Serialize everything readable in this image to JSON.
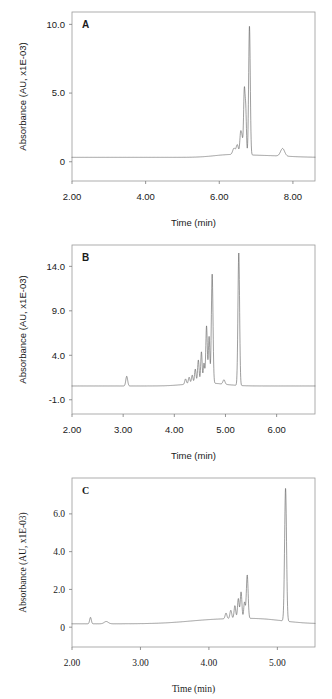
{
  "figure": {
    "name": "hplc-chromatogram-figure",
    "panel_count": 3
  },
  "chart_data": [
    {
      "id": "A",
      "type": "line",
      "panel_letter": "A",
      "title": "",
      "xlabel": "Time (min)",
      "ylabel": "Absorbance (AU, x1E-03)",
      "font_style": "sans-serif",
      "xlim": [
        2.0,
        8.6
      ],
      "ylim": [
        -1.4,
        10.9
      ],
      "xticks": [
        2.0,
        4.0,
        6.0,
        8.0
      ],
      "xtick_labels": [
        "2.00",
        "4.00",
        "6.00",
        "8.00"
      ],
      "yticks": [
        0,
        5.0,
        10.0
      ],
      "ytick_labels": [
        "0",
        "5.0",
        "10.0"
      ],
      "grid": false,
      "legend": "none",
      "baseline": 0.32,
      "series": [
        {
          "name": "absorbance",
          "peaks": [
            {
              "center": 6.4,
              "height": 0.45,
              "width": 0.035
            },
            {
              "center": 6.49,
              "height": 0.7,
              "width": 0.03
            },
            {
              "center": 6.58,
              "height": 1.55,
              "width": 0.022
            },
            {
              "center": 6.62,
              "height": 1.05,
              "width": 0.02
            },
            {
              "center": 6.68,
              "height": 4.65,
              "width": 0.02
            },
            {
              "center": 6.72,
              "height": 3.0,
              "width": 0.018
            },
            {
              "center": 6.82,
              "height": 9.4,
              "width": 0.022
            },
            {
              "center": 7.72,
              "height": 0.55,
              "width": 0.055
            }
          ],
          "drift": [
            {
              "center": 6.3,
              "height": 0.18,
              "width": 0.45
            },
            {
              "center": 7.3,
              "height": 0.12,
              "width": 0.6
            }
          ]
        }
      ]
    },
    {
      "id": "B",
      "type": "line",
      "panel_letter": "B",
      "title": "",
      "xlabel": "Time (min)",
      "ylabel": "Absorbance (AU, x1E-03)",
      "font_style": "sans-serif",
      "xlim": [
        2.0,
        6.75
      ],
      "ylim": [
        -2.6,
        16.4
      ],
      "xticks": [
        2.0,
        3.0,
        4.0,
        5.0,
        6.0
      ],
      "xtick_labels": [
        "2.00",
        "3.00",
        "4.00",
        "5.00",
        "6.00"
      ],
      "yticks": [
        -1.0,
        4.0,
        9.0,
        14.0
      ],
      "ytick_labels": [
        "-1.0",
        "4.0",
        "9.0",
        "14.0"
      ],
      "grid": false,
      "legend": "none",
      "baseline": 0.55,
      "series": [
        {
          "name": "absorbance",
          "peaks": [
            {
              "center": 3.07,
              "height": 1.1,
              "width": 0.018
            },
            {
              "center": 4.22,
              "height": 0.6,
              "width": 0.016
            },
            {
              "center": 4.29,
              "height": 0.75,
              "width": 0.016
            },
            {
              "center": 4.35,
              "height": 0.95,
              "width": 0.015
            },
            {
              "center": 4.41,
              "height": 1.6,
              "width": 0.015
            },
            {
              "center": 4.47,
              "height": 2.6,
              "width": 0.015
            },
            {
              "center": 4.53,
              "height": 3.5,
              "width": 0.014
            },
            {
              "center": 4.58,
              "height": 2.2,
              "width": 0.014
            },
            {
              "center": 4.63,
              "height": 6.4,
              "width": 0.015
            },
            {
              "center": 4.68,
              "height": 5.2,
              "width": 0.014
            },
            {
              "center": 4.74,
              "height": 12.3,
              "width": 0.016
            },
            {
              "center": 4.97,
              "height": 0.5,
              "width": 0.02
            },
            {
              "center": 5.26,
              "height": 14.9,
              "width": 0.016
            }
          ],
          "drift": [
            {
              "center": 4.6,
              "height": 0.35,
              "width": 0.35
            }
          ]
        }
      ]
    },
    {
      "id": "C",
      "type": "line",
      "panel_letter": "C",
      "title": "",
      "xlabel": "Time (min)",
      "ylabel": "Absorbance (AU, x1E-03)",
      "font_style": "serif",
      "xlim": [
        2.0,
        5.55
      ],
      "ylim": [
        -1.05,
        7.9
      ],
      "xticks": [
        2.0,
        3.0,
        4.0,
        5.0
      ],
      "xtick_labels": [
        "2.00",
        "3.00",
        "4.00",
        "5.00"
      ],
      "yticks": [
        0,
        2.0,
        4.0,
        6.0
      ],
      "ytick_labels": [
        "0",
        "2.0",
        "4.0",
        "6.0"
      ],
      "grid": false,
      "legend": "none",
      "baseline": 0.18,
      "series": [
        {
          "name": "absorbance",
          "peaks": [
            {
              "center": 2.27,
              "height": 0.34,
              "width": 0.012
            },
            {
              "center": 2.5,
              "height": 0.12,
              "width": 0.03
            },
            {
              "center": 4.25,
              "height": 0.3,
              "width": 0.013
            },
            {
              "center": 4.32,
              "height": 0.44,
              "width": 0.013
            },
            {
              "center": 4.38,
              "height": 0.68,
              "width": 0.012
            },
            {
              "center": 4.43,
              "height": 1.05,
              "width": 0.012
            },
            {
              "center": 4.47,
              "height": 1.4,
              "width": 0.012
            },
            {
              "center": 4.52,
              "height": 0.85,
              "width": 0.011
            },
            {
              "center": 4.56,
              "height": 2.3,
              "width": 0.013
            },
            {
              "center": 5.12,
              "height": 7.05,
              "width": 0.014
            }
          ],
          "drift": [
            {
              "center": 4.15,
              "height": 0.22,
              "width": 0.45
            },
            {
              "center": 4.8,
              "height": 0.18,
              "width": 0.35
            }
          ]
        }
      ]
    }
  ]
}
